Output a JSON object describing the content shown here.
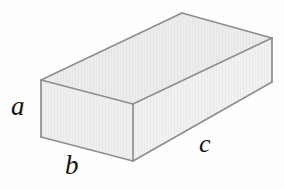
{
  "figure": {
    "name": "rectangular-prism-diagram",
    "type": "3d-geometry-illustration",
    "shape": "rectangular prism",
    "background_color": "#fefefe",
    "face_fill_color": "#ececec",
    "edge_color": "#8e8e8e",
    "label_color": "#141414",
    "labels": {
      "height": "a",
      "width": "b",
      "length": "c"
    },
    "geometry": {
      "vertices": {
        "front_top_left": [
          41,
          80
        ],
        "front_top_right": [
          133,
          104
        ],
        "front_bottom_left": [
          41,
          137
        ],
        "front_bottom_right": [
          133,
          161
        ],
        "top_rear_apex": [
          182,
          13
        ],
        "top_rear_right": [
          272,
          38
        ],
        "right_bottom": [
          272,
          82
        ]
      },
      "faces": [
        {
          "name": "top-face",
          "points": "41,80 182,13 272,38 133,104"
        },
        {
          "name": "left-end-face",
          "points": "41,80 133,104 133,161 41,137"
        },
        {
          "name": "front-long-face",
          "points": "133,104 272,38 272,82 133,161"
        }
      ],
      "edges": [
        {
          "name": "top-left-back-edge",
          "from": [
            41,
            80
          ],
          "to": [
            182,
            13
          ]
        },
        {
          "name": "top-back-right-edge",
          "from": [
            182,
            13
          ],
          "to": [
            272,
            38
          ]
        },
        {
          "name": "top-right-front-edge",
          "from": [
            272,
            38
          ],
          "to": [
            133,
            104
          ]
        },
        {
          "name": "top-front-left-edge",
          "from": [
            133,
            104
          ],
          "to": [
            41,
            80
          ]
        },
        {
          "name": "left-vertical-edge",
          "from": [
            41,
            80
          ],
          "to": [
            41,
            137
          ]
        },
        {
          "name": "middle-vertical-edge",
          "from": [
            133,
            104
          ],
          "to": [
            133,
            161
          ]
        },
        {
          "name": "right-vertical-edge",
          "from": [
            272,
            38
          ],
          "to": [
            272,
            82
          ]
        },
        {
          "name": "bottom-left-edge",
          "from": [
            41,
            137
          ],
          "to": [
            133,
            161
          ]
        },
        {
          "name": "bottom-right-edge",
          "from": [
            133,
            161
          ],
          "to": [
            272,
            82
          ]
        }
      ]
    }
  }
}
